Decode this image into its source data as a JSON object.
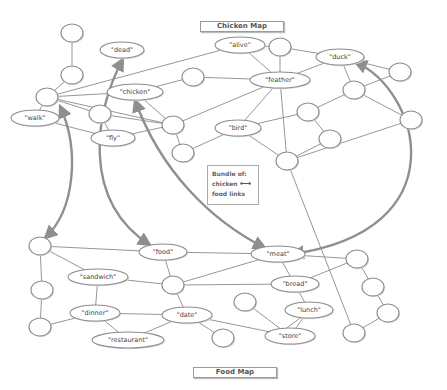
{
  "titles": {
    "chicken_map": "Chicken Map",
    "food_map": "Food Map"
  },
  "legend": {
    "line1": "Bundle of:",
    "line2": "chicken",
    "line3": "food links",
    "arrow_icon": "double-arrow-icon",
    "arrow_glyph": "⟷"
  },
  "colors": {
    "edge": "#8a8a8a",
    "node_stroke": "#8c8c8c",
    "bundle": "#8f8f8f"
  },
  "nodes": [
    {
      "id": "c_t1",
      "label": "",
      "map": "chicken"
    },
    {
      "id": "c_t2",
      "label": "",
      "map": "chicken"
    },
    {
      "id": "c_l",
      "label": "",
      "map": "chicken"
    },
    {
      "id": "dead",
      "label": "\"dead\"",
      "map": "chicken"
    },
    {
      "id": "alive",
      "label": "\"alive\"",
      "map": "chicken"
    },
    {
      "id": "c_top",
      "label": "",
      "map": "chicken"
    },
    {
      "id": "duck",
      "label": "\"duck\"",
      "map": "chicken"
    },
    {
      "id": "c_dr",
      "label": "",
      "map": "chicken"
    },
    {
      "id": "chicken",
      "label": "\"chicken\"",
      "map": "chicken"
    },
    {
      "id": "c_c2",
      "label": "",
      "map": "chicken"
    },
    {
      "id": "feather",
      "label": "\"feather\"",
      "map": "chicken"
    },
    {
      "id": "walk",
      "label": "\"walk\"",
      "map": "chicken"
    },
    {
      "id": "c_wc",
      "label": "",
      "map": "chicken"
    },
    {
      "id": "fly",
      "label": "\"fly\"",
      "map": "chicken"
    },
    {
      "id": "c_hub",
      "label": "",
      "map": "chicken"
    },
    {
      "id": "c_below",
      "label": "",
      "map": "chicken"
    },
    {
      "id": "bird",
      "label": "\"bird\"",
      "map": "chicken"
    },
    {
      "id": "c_m2",
      "label": "",
      "map": "chicken"
    },
    {
      "id": "c_d2",
      "label": "",
      "map": "chicken"
    },
    {
      "id": "c_r2",
      "label": "",
      "map": "chicken"
    },
    {
      "id": "c_r3",
      "label": "",
      "map": "chicken"
    },
    {
      "id": "c_bot",
      "label": "",
      "map": "chicken"
    },
    {
      "id": "f_l1",
      "label": "",
      "map": "food"
    },
    {
      "id": "f_l2",
      "label": "",
      "map": "food"
    },
    {
      "id": "f_l3",
      "label": "",
      "map": "food"
    },
    {
      "id": "food",
      "label": "\"food\"",
      "map": "food"
    },
    {
      "id": "meat",
      "label": "\"meat\"",
      "map": "food"
    },
    {
      "id": "f_r1",
      "label": "",
      "map": "food"
    },
    {
      "id": "sandwich",
      "label": "\"sandwich\"",
      "map": "food"
    },
    {
      "id": "f_c",
      "label": "",
      "map": "food"
    },
    {
      "id": "bread",
      "label": "\"bread\"",
      "map": "food"
    },
    {
      "id": "f_r2",
      "label": "",
      "map": "food"
    },
    {
      "id": "f_s",
      "label": "",
      "map": "food"
    },
    {
      "id": "lunch",
      "label": "\"lunch\"",
      "map": "food"
    },
    {
      "id": "f_r3",
      "label": "",
      "map": "food"
    },
    {
      "id": "dinner",
      "label": "\"dinner\"",
      "map": "food"
    },
    {
      "id": "date",
      "label": "\"date\"",
      "map": "food"
    },
    {
      "id": "f_b",
      "label": "",
      "map": "food"
    },
    {
      "id": "store",
      "label": "\"store\"",
      "map": "food"
    },
    {
      "id": "f_r4",
      "label": "",
      "map": "food"
    },
    {
      "id": "restaurant",
      "label": "\"restaurant\"",
      "map": "food"
    }
  ],
  "edges": [
    [
      "c_t1",
      "c_t2"
    ],
    [
      "c_t2",
      "c_l"
    ],
    [
      "c_l",
      "alive"
    ],
    [
      "c_l",
      "chicken"
    ],
    [
      "c_l",
      "walk"
    ],
    [
      "c_l",
      "c_wc"
    ],
    [
      "c_l",
      "c_hub"
    ],
    [
      "walk",
      "fly"
    ],
    [
      "c_wc",
      "fly"
    ],
    [
      "c_wc",
      "c_hub"
    ],
    [
      "chicken",
      "c_hub"
    ],
    [
      "fly",
      "c_hub"
    ],
    [
      "chicken",
      "c_c2"
    ],
    [
      "c_c2",
      "feather"
    ],
    [
      "alive",
      "feather"
    ],
    [
      "alive",
      "c_top"
    ],
    [
      "c_top",
      "feather"
    ],
    [
      "c_top",
      "duck"
    ],
    [
      "c_hub",
      "feather"
    ],
    [
      "c_hub",
      "c_below"
    ],
    [
      "c_below",
      "bird"
    ],
    [
      "bird",
      "feather"
    ],
    [
      "feather",
      "duck"
    ],
    [
      "feather",
      "c_bot"
    ],
    [
      "bird",
      "c_bot"
    ],
    [
      "bird",
      "c_m2"
    ],
    [
      "c_m2",
      "c_r3"
    ],
    [
      "c_m2",
      "c_d2"
    ],
    [
      "duck",
      "c_d2"
    ],
    [
      "duck",
      "c_dr"
    ],
    [
      "c_d2",
      "c_r2"
    ],
    [
      "c_d2",
      "c_dr"
    ],
    [
      "c_r3",
      "c_bot"
    ],
    [
      "c_r2",
      "c_bot"
    ],
    [
      "c_bot",
      "f_r4"
    ],
    [
      "f_l1",
      "f_l2"
    ],
    [
      "f_l2",
      "f_l3"
    ],
    [
      "f_l1",
      "food"
    ],
    [
      "f_l1",
      "sandwich"
    ],
    [
      "food",
      "meat"
    ],
    [
      "food",
      "f_c"
    ],
    [
      "sandwich",
      "f_c"
    ],
    [
      "sandwich",
      "dinner"
    ],
    [
      "f_l3",
      "dinner"
    ],
    [
      "f_c",
      "meat"
    ],
    [
      "f_c",
      "bread"
    ],
    [
      "f_c",
      "date"
    ],
    [
      "meat",
      "f_r1"
    ],
    [
      "meat",
      "lunch"
    ],
    [
      "bread",
      "f_r1"
    ],
    [
      "f_r1",
      "f_r2"
    ],
    [
      "f_r2",
      "f_r3"
    ],
    [
      "f_r3",
      "f_r4"
    ],
    [
      "dinner",
      "date"
    ],
    [
      "dinner",
      "restaurant"
    ],
    [
      "date",
      "restaurant"
    ],
    [
      "date",
      "f_b"
    ],
    [
      "date",
      "store"
    ],
    [
      "f_s",
      "store"
    ],
    [
      "lunch",
      "store"
    ],
    [
      "lunch",
      "store2"
    ]
  ]
}
